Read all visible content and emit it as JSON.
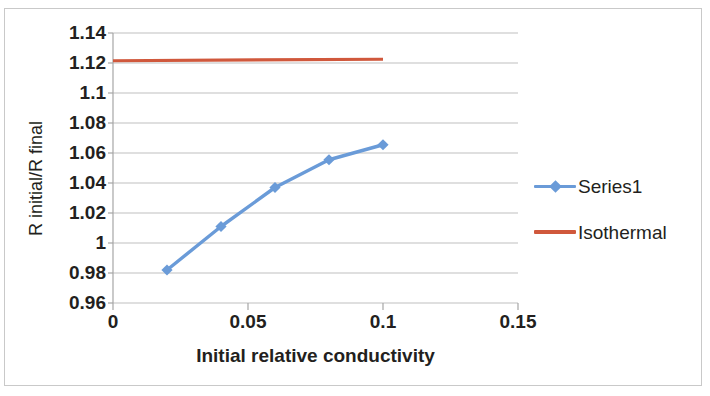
{
  "chart_data": {
    "type": "line",
    "title": "",
    "xlabel": "Initial relative conductivity",
    "ylabel": "R initial/R final",
    "xlim": [
      0,
      0.15
    ],
    "ylim": [
      0.96,
      1.14
    ],
    "xticks": [
      "0",
      "0.05",
      "0.1",
      "0.15"
    ],
    "xtick_values": [
      0,
      0.05,
      0.1,
      0.15
    ],
    "yticks": [
      "0.96",
      "0.98",
      "1",
      "1.02",
      "1.04",
      "1.06",
      "1.08",
      "1.1",
      "1.12",
      "1.14"
    ],
    "ytick_values": [
      0.96,
      0.98,
      1.0,
      1.02,
      1.04,
      1.06,
      1.08,
      1.1,
      1.12,
      1.14
    ],
    "grid": "horizontal",
    "legend_position": "right",
    "x": [
      0.02,
      0.04,
      0.06,
      0.08,
      0.1
    ],
    "series": [
      {
        "name": "Series1",
        "color": "#6a9bd8",
        "marker": "diamond",
        "x": [
          0.02,
          0.04,
          0.06,
          0.08,
          0.1
        ],
        "values": [
          0.982,
          1.011,
          1.037,
          1.0555,
          1.0655
        ]
      },
      {
        "name": "Isothermal",
        "color": "#d0583c",
        "marker": "none",
        "x": [
          0.0,
          0.1
        ],
        "values": [
          1.1215,
          1.1225
        ]
      }
    ]
  },
  "axes": {
    "x_title": "Initial relative conductivity",
    "y_title": "R initial/R final"
  },
  "legend": {
    "items": [
      {
        "label": "Series1",
        "color": "#6a9bd8",
        "marker": "diamond"
      },
      {
        "label": "Isothermal",
        "color": "#d0583c",
        "marker": "none"
      }
    ]
  },
  "colors": {
    "series1": "#6a9bd8",
    "isothermal": "#d0583c",
    "grid": "#bfbfbf",
    "axis": "#a6a6a6",
    "frame": "#c9c9c9",
    "text": "#231f20"
  }
}
